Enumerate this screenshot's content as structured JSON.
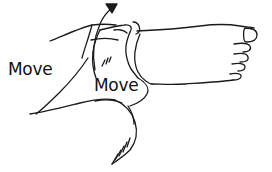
{
  "illustration": {
    "subject": "hand moving foot at ankle",
    "labels": [
      {
        "text": "Move",
        "position": "left"
      },
      {
        "text": "Move",
        "position": "center"
      }
    ],
    "arrow": {
      "direction": "up-right",
      "meaning": "rotation-direction"
    },
    "colors": {
      "stroke": "#1a1a1a",
      "background": "#ffffff",
      "text": "#111111"
    }
  }
}
